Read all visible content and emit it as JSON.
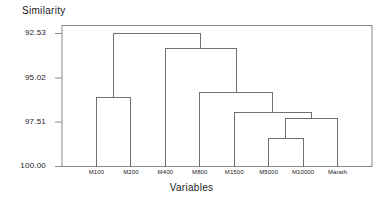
{
  "chart_data": {
    "type": "line",
    "subtype": "dendrogram",
    "title": "",
    "ylabel": "Similarity",
    "xlabel": "Variables",
    "grid": false,
    "legend": "none",
    "orientation": "vertical",
    "yaxis_inverted": true,
    "ylim": [
      92.53,
      100.0
    ],
    "ytick_labels": [
      "92.53",
      "95.02",
      "97.51",
      "100.00"
    ],
    "ytick_values": [
      92.53,
      95.02,
      97.51,
      100.0
    ],
    "categories": [
      "M100",
      "M200",
      "M400",
      "M800",
      "M1500",
      "M5000",
      "M10000",
      "Marath"
    ],
    "leaf_order": [
      "M100",
      "M200",
      "M400",
      "M800",
      "M1500",
      "M5000",
      "M10000",
      "Marath"
    ],
    "merges": [
      {
        "id": "n1",
        "left": "M5000",
        "right": "M10000",
        "similarity": 98.4
      },
      {
        "id": "n2",
        "left": "n1",
        "right": "Marath",
        "similarity": 97.28
      },
      {
        "id": "n3",
        "left": "M1500",
        "right": "n2",
        "similarity": 96.98
      },
      {
        "id": "n4",
        "left": "M800",
        "right": "n3",
        "similarity": 95.87
      },
      {
        "id": "n5",
        "left": "M100",
        "right": "M200",
        "similarity": 96.12
      },
      {
        "id": "n6",
        "left": "M400",
        "right": "n4",
        "similarity": 93.35
      },
      {
        "id": "n7",
        "left": "n5",
        "right": "n6",
        "similarity": 92.53
      }
    ]
  },
  "axis": {
    "y_title": "Similarity",
    "x_title": "Variables"
  },
  "colors": {
    "line": "#6f6f6f",
    "frame": "#8a8a8a",
    "text": "#1a1a1a",
    "background": "#ffffff"
  }
}
